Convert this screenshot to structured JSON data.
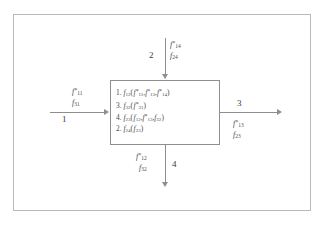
{
  "diagram": {
    "frame": {
      "border_color": "#b9b9b9"
    },
    "process_box": {
      "border_color": "#8e8e8e",
      "steps": [
        {
          "order": "1.",
          "fn": "f",
          "fn_sub": "12",
          "args": "( f*11, f*13, f*14)"
        },
        {
          "order": "3.",
          "fn": "f",
          "fn_sub": "32",
          "args": "( f*31)"
        },
        {
          "order": "4.",
          "fn": "f",
          "fn_sub": "23",
          "args": "( f12, f*13, f32)"
        },
        {
          "order": "2.",
          "fn": "f",
          "fn_sub": "24",
          "args": "( f23)"
        }
      ]
    },
    "ports": [
      {
        "id": "port-1-left-input",
        "index": "1",
        "direction": "input",
        "side": "left",
        "signals": [
          {
            "base": "f",
            "sub": "11",
            "starred": true
          },
          {
            "base": "f",
            "sub": "31",
            "starred": false
          }
        ]
      },
      {
        "id": "port-2-top-input",
        "index": "2",
        "direction": "input",
        "side": "top",
        "signals": [
          {
            "base": "f",
            "sub": "14",
            "starred": true
          },
          {
            "base": "f",
            "sub": "24",
            "starred": false
          }
        ]
      },
      {
        "id": "port-3-right-output",
        "index": "3",
        "direction": "output",
        "side": "right",
        "signals": [
          {
            "base": "f",
            "sub": "13",
            "starred": true
          },
          {
            "base": "f",
            "sub": "23",
            "starred": false
          }
        ]
      },
      {
        "id": "port-4-bottom-output",
        "index": "4",
        "direction": "output",
        "side": "bottom",
        "signals": [
          {
            "base": "f",
            "sub": "12",
            "starred": true
          },
          {
            "base": "f",
            "sub": "32",
            "starred": false
          }
        ]
      }
    ]
  }
}
